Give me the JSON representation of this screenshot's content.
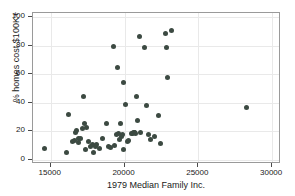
{
  "chart_data": {
    "type": "scatter",
    "title": "",
    "xlabel": "1979 Median Family Inc.",
    "ylabel": "% homes cost $100K+",
    "xlim": [
      13800,
      30600
    ],
    "ylim": [
      -3,
      103
    ],
    "xticks": [
      15000,
      20000,
      25000,
      30000
    ],
    "xticklabels": [
      "15000",
      "20000",
      "25000",
      "30000"
    ],
    "yticks": [
      0,
      20,
      40,
      60,
      80,
      100
    ],
    "yticklabels": [
      "0",
      "20",
      "40",
      "60",
      "80",
      "100"
    ],
    "grid": "faint light-gray gridlines at tick positions",
    "legend": "none",
    "marker": {
      "shape": "circle",
      "color": "#3c4a42",
      "size_px": 5
    },
    "frame_color": "#9a9a9a",
    "background": "#ffffff",
    "n_points": 62,
    "points": [
      {
        "x": 14600,
        "y": 7.6
      },
      {
        "x": 16050,
        "y": 5.0
      },
      {
        "x": 16200,
        "y": 31.6
      },
      {
        "x": 16500,
        "y": 12.8
      },
      {
        "x": 16600,
        "y": 13.6
      },
      {
        "x": 16700,
        "y": 19.4
      },
      {
        "x": 16750,
        "y": 20.2
      },
      {
        "x": 16850,
        "y": 14.8
      },
      {
        "x": 16900,
        "y": 11.8
      },
      {
        "x": 17050,
        "y": 15.2
      },
      {
        "x": 17150,
        "y": 21.6
      },
      {
        "x": 17250,
        "y": 44.2
      },
      {
        "x": 17300,
        "y": 25.2
      },
      {
        "x": 17350,
        "y": 7.4
      },
      {
        "x": 17400,
        "y": 22.6
      },
      {
        "x": 17550,
        "y": 13.0
      },
      {
        "x": 17700,
        "y": 9.4
      },
      {
        "x": 17800,
        "y": 10.6
      },
      {
        "x": 17900,
        "y": 5.4
      },
      {
        "x": 18000,
        "y": 9.2
      },
      {
        "x": 18100,
        "y": 10.6
      },
      {
        "x": 18300,
        "y": 8.0
      },
      {
        "x": 18500,
        "y": 14.6
      },
      {
        "x": 18750,
        "y": 25.4
      },
      {
        "x": 18900,
        "y": 9.0
      },
      {
        "x": 19050,
        "y": 8.6
      },
      {
        "x": 19250,
        "y": 79.6
      },
      {
        "x": 19300,
        "y": 10.2
      },
      {
        "x": 19450,
        "y": 17.6
      },
      {
        "x": 19550,
        "y": 65.0
      },
      {
        "x": 19600,
        "y": 18.2
      },
      {
        "x": 19650,
        "y": 14.2
      },
      {
        "x": 19700,
        "y": 25.4
      },
      {
        "x": 19800,
        "y": 16.6
      },
      {
        "x": 19850,
        "y": 17.4
      },
      {
        "x": 19900,
        "y": 7.0
      },
      {
        "x": 19950,
        "y": 54.0
      },
      {
        "x": 20050,
        "y": 38.8
      },
      {
        "x": 20200,
        "y": 12.6
      },
      {
        "x": 20300,
        "y": 13.4
      },
      {
        "x": 20450,
        "y": 18.2
      },
      {
        "x": 20550,
        "y": 18.6
      },
      {
        "x": 20600,
        "y": 19.4
      },
      {
        "x": 20650,
        "y": 18.8
      },
      {
        "x": 20700,
        "y": 19.2
      },
      {
        "x": 20750,
        "y": 18.4
      },
      {
        "x": 20800,
        "y": 44.6
      },
      {
        "x": 20900,
        "y": 27.4
      },
      {
        "x": 21000,
        "y": 86.8
      },
      {
        "x": 21100,
        "y": 18.8
      },
      {
        "x": 21350,
        "y": 78.6
      },
      {
        "x": 21500,
        "y": 38.4
      },
      {
        "x": 21600,
        "y": 17.4
      },
      {
        "x": 21750,
        "y": 14.2
      },
      {
        "x": 22000,
        "y": 16.2
      },
      {
        "x": 22300,
        "y": 31.0
      },
      {
        "x": 22450,
        "y": 11.4
      },
      {
        "x": 22800,
        "y": 88.8
      },
      {
        "x": 22850,
        "y": 79.0
      },
      {
        "x": 22900,
        "y": 57.6
      },
      {
        "x": 23150,
        "y": 90.6
      },
      {
        "x": 28250,
        "y": 36.6
      }
    ]
  },
  "page_edge_text": ""
}
